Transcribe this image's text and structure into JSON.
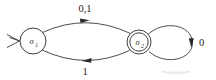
{
  "diagram": {
    "kind": "finite-state-automaton",
    "background_color": "#ffffff",
    "line_color": "#3a3a3a",
    "text_color": "#232323",
    "states": [
      {
        "id": "s1",
        "label_base": "σ",
        "label_subscript": "1",
        "label_full": "σ1",
        "is_start": true,
        "is_accepting": false,
        "cx": 33,
        "cy": 41,
        "r": 13
      },
      {
        "id": "s2",
        "label_base": "σ",
        "label_subscript": "2",
        "label_full": "σ2",
        "is_start": false,
        "is_accepting": true,
        "cx": 139,
        "cy": 42,
        "r_outer": 12,
        "r_inner": 9.2
      }
    ],
    "transitions": [
      {
        "id": "t-top",
        "from": "s1",
        "to": "s2",
        "label": "0,1",
        "label_x": 85,
        "label_y": 12,
        "direction": "right",
        "shape": "arc-above"
      },
      {
        "id": "t-bottom",
        "from": "s2",
        "to": "s1",
        "label": "1",
        "label_x": 85,
        "label_y": 74,
        "direction": "left",
        "shape": "arc-below"
      },
      {
        "id": "t-loop",
        "from": "s2",
        "to": "s2",
        "label": "0",
        "label_x": 202,
        "label_y": 46,
        "direction": "clockwise",
        "shape": "self-loop-right"
      }
    ],
    "start_marker": {
      "name": "start-arrowhead",
      "x": 11,
      "y": 41,
      "glyph": ">"
    }
  }
}
